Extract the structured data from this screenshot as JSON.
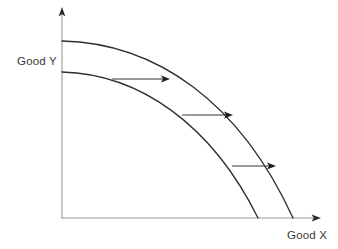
{
  "diagram": {
    "background_color": "#ffffff",
    "axes": {
      "y_axis": {
        "label": "Good Y",
        "label_name": "y-axis-label",
        "color": "#9a9a9a",
        "arrow": "up-arrow"
      },
      "x_axis": {
        "label": "Good X",
        "label_name": "x-axis-label",
        "color": "#9a9a9a",
        "arrow": "right-arrow"
      },
      "origin": {
        "x": 62,
        "y": 218
      }
    },
    "curves": [
      {
        "name": "inner-ppf-curve",
        "description": "original production possibility frontier",
        "color": "#2e2e2e",
        "y_intercept": {
          "x": 62,
          "y": 72
        },
        "x_intercept": {
          "x": 258,
          "y": 218
        },
        "path": "M 62 72 C 140 74 212 125 258 218"
      },
      {
        "name": "outer-ppf-curve",
        "description": "expanded production possibility frontier after growth",
        "color": "#2e2e2e",
        "y_intercept": {
          "x": 62,
          "y": 41
        },
        "x_intercept": {
          "x": 293,
          "y": 218
        },
        "path": "M 62 41 C 156 43 240 102 293 218"
      }
    ],
    "shift_arrows": [
      {
        "name": "shift-arrow-top",
        "x1": 112,
        "y1": 79,
        "x2": 163,
        "y2": 79
      },
      {
        "name": "shift-arrow-middle",
        "x1": 182,
        "y1": 115,
        "x2": 226,
        "y2": 115
      },
      {
        "name": "shift-arrow-bottom",
        "x1": 232,
        "y1": 166,
        "x2": 269,
        "y2": 166
      }
    ]
  },
  "chart_data": {
    "type": "line",
    "title": "",
    "xlabel": "Good X",
    "ylabel": "Good Y",
    "grid": false,
    "legend": "none",
    "annotations": [
      "outward shift arrow",
      "outward shift arrow",
      "outward shift arrow"
    ],
    "series": [
      {
        "name": "Original PPF",
        "x": [
          0,
          20,
          40,
          60,
          80,
          90,
          100
        ],
        "y": [
          100,
          99,
          95,
          87,
          70,
          53,
          0
        ]
      },
      {
        "name": "New PPF",
        "x": [
          0,
          20,
          40,
          60,
          80,
          90,
          100
        ],
        "y": [
          100,
          99,
          96,
          90,
          77,
          63,
          0
        ]
      }
    ]
  }
}
